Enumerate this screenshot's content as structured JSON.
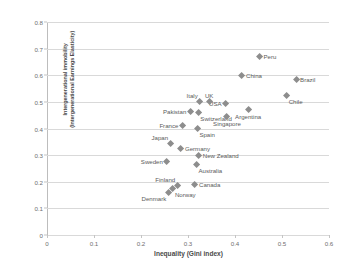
{
  "chart_data": {
    "type": "scatter",
    "title": "",
    "xlabel": "Inequality (Gini index)",
    "ylabel": "Intergenerational immobility (Intergenerational Earnings Elasticity)",
    "ylabel_line1": "Intergenerational immobility",
    "ylabel_line2": "(Intergenerational Earnings Elasticity)",
    "xlim": [
      0,
      0.6
    ],
    "ylim": [
      0,
      0.8
    ],
    "xticks": [
      "0",
      "0.1",
      "0.2",
      "0.3",
      "0.4",
      "0.5",
      "0.6"
    ],
    "xtick_values": [
      0,
      0.1,
      0.2,
      0.3,
      0.4,
      0.5,
      0.6
    ],
    "yticks": [
      "0",
      "0.1",
      "0.2",
      "0.3",
      "0.4",
      "0.5",
      "0.6",
      "0.7",
      "0.8"
    ],
    "ytick_values": [
      0,
      0.1,
      0.2,
      0.3,
      0.4,
      0.5,
      0.6,
      0.7,
      0.8
    ],
    "grid": "horizontal",
    "legend": "none",
    "marker_shape": "diamond",
    "marker_color": "#8d8d8d",
    "points": [
      {
        "label": "Peru",
        "x": 0.452,
        "y": 0.67,
        "pos": "lbl-right"
      },
      {
        "label": "China",
        "x": 0.415,
        "y": 0.6,
        "pos": "lbl-right"
      },
      {
        "label": "Brazil",
        "x": 0.53,
        "y": 0.585,
        "pos": "lbl-right"
      },
      {
        "label": "Chile",
        "x": 0.51,
        "y": 0.525,
        "pos": "lbl-below-right"
      },
      {
        "label": "USA",
        "x": 0.38,
        "y": 0.495,
        "pos": "lbl-left"
      },
      {
        "label": "UK",
        "x": 0.345,
        "y": 0.5,
        "pos": "lbl-above"
      },
      {
        "label": "Italy",
        "x": 0.325,
        "y": 0.5,
        "pos": "lbl-above-left"
      },
      {
        "label": "Argentina",
        "x": 0.428,
        "y": 0.47,
        "pos": "lbl-below"
      },
      {
        "label": "Pakistan",
        "x": 0.305,
        "y": 0.462,
        "pos": "lbl-left"
      },
      {
        "label": "Switzerland",
        "x": 0.322,
        "y": 0.46,
        "pos": "lbl-below-right"
      },
      {
        "label": "Singapore",
        "x": 0.383,
        "y": 0.443,
        "pos": "lbl-below"
      },
      {
        "label": "France",
        "x": 0.288,
        "y": 0.412,
        "pos": "lbl-left"
      },
      {
        "label": "Spain",
        "x": 0.32,
        "y": 0.4,
        "pos": "lbl-below-right"
      },
      {
        "label": "Japan",
        "x": 0.262,
        "y": 0.345,
        "pos": "lbl-above-left"
      },
      {
        "label": "Germany",
        "x": 0.285,
        "y": 0.325,
        "pos": "lbl-right"
      },
      {
        "label": "New Zealand",
        "x": 0.323,
        "y": 0.3,
        "pos": "lbl-right"
      },
      {
        "label": "Sweden",
        "x": 0.255,
        "y": 0.275,
        "pos": "lbl-left"
      },
      {
        "label": "Australia",
        "x": 0.318,
        "y": 0.265,
        "pos": "lbl-below-right"
      },
      {
        "label": "Canada",
        "x": 0.315,
        "y": 0.19,
        "pos": "lbl-right"
      },
      {
        "label": "Finland",
        "x": 0.277,
        "y": 0.185,
        "pos": "lbl-above-left"
      },
      {
        "label": "Norway",
        "x": 0.268,
        "y": 0.173,
        "pos": "lbl-below-right"
      },
      {
        "label": "Denmark",
        "x": 0.258,
        "y": 0.16,
        "pos": "lbl-below-left"
      }
    ]
  }
}
